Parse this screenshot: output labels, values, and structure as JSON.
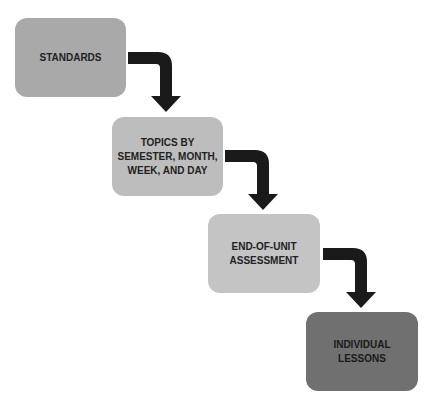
{
  "diagram": {
    "type": "flowchart",
    "steps": [
      {
        "label": "STANDARDS",
        "color": "#a9a9a9"
      },
      {
        "label": "TOPICS BY SEMESTER, MONTH, WEEK, AND DAY",
        "color": "#bdbdbd"
      },
      {
        "label": "END-OF-UNIT ASSESSMENT",
        "color": "#c4c4c4"
      },
      {
        "label": "INDIVIDUAL LESSONS",
        "color": "#707070"
      }
    ],
    "arrow_color": "#1a1a1a"
  }
}
